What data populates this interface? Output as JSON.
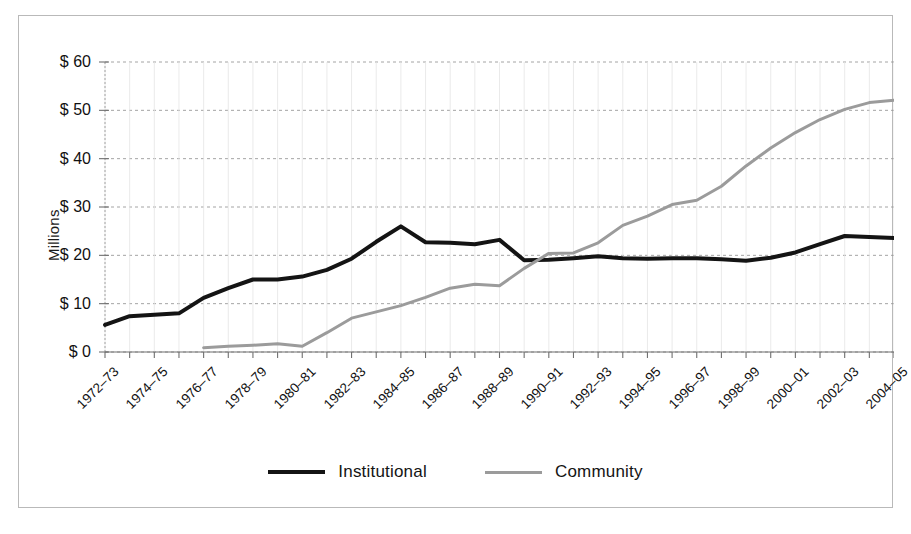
{
  "chart_data": {
    "type": "line",
    "title": "",
    "subtitle": "",
    "xlabel": "",
    "ylabel": "Millions",
    "ylim": [
      0,
      60
    ],
    "ytick_values": [
      0,
      10,
      20,
      30,
      40,
      50,
      60
    ],
    "ytick_labels": [
      "$ 0",
      "$ 10",
      "$ 20",
      "$ 30",
      "$ 40",
      "$ 50",
      "$ 60"
    ],
    "grid": true,
    "grid_style": "dashed-horizontal",
    "legend_position": "bottom-center",
    "x": [
      "1972-73",
      "1973-74",
      "1974-75",
      "1975-76",
      "1976-77",
      "1977-78",
      "1978-79",
      "1979-80",
      "1980-81",
      "1981-82",
      "1982-83",
      "1983-84",
      "1984-85",
      "1985-86",
      "1986-87",
      "1987-88",
      "1988-89",
      "1989-90",
      "1990-91",
      "1991-92",
      "1992-93",
      "1993-94",
      "1994-95",
      "1995-96",
      "1996-97",
      "1997-98",
      "1998-99",
      "1999-00",
      "2000-01",
      "2001-02",
      "2002-03",
      "2003-04",
      "2004-05"
    ],
    "xtick_labels": [
      "1972–73",
      "1974–75",
      "1976–77",
      "1978–79",
      "1980–81",
      "1982–83",
      "1984–85",
      "1986–87",
      "1988–89",
      "1990–91",
      "1992–93",
      "1994–95",
      "1996–97",
      "1998–99",
      "2000–01",
      "2002–03",
      "2004–05"
    ],
    "xtick_indices": [
      0,
      2,
      4,
      6,
      8,
      10,
      12,
      14,
      16,
      18,
      20,
      22,
      24,
      26,
      28,
      30,
      32
    ],
    "series": [
      {
        "name": "Institutional",
        "color": "#141414",
        "width": 4,
        "values": [
          5.6,
          7.4,
          7.7,
          8.0,
          11.2,
          13.2,
          15.0,
          15.0,
          15.6,
          17.0,
          19.3,
          22.8,
          26.0,
          22.7,
          22.6,
          22.3,
          23.2,
          19.0,
          19.1,
          19.4,
          19.8,
          19.4,
          19.3,
          19.4,
          19.4,
          19.2,
          18.9,
          19.5,
          20.6,
          22.3,
          24.0,
          23.8,
          23.6
        ]
      },
      {
        "name": "Community",
        "color": "#9b9b9b",
        "width": 3,
        "values": [
          null,
          null,
          null,
          null,
          0.9,
          1.2,
          1.4,
          1.7,
          1.2,
          4.0,
          7.0,
          8.3,
          9.6,
          11.3,
          13.2,
          14.0,
          13.7,
          17.3,
          20.4,
          20.5,
          22.6,
          26.2,
          28.1,
          30.5,
          31.4,
          34.3,
          38.5,
          42.2,
          45.4,
          48.1,
          50.2,
          51.6,
          52.1
        ]
      }
    ]
  },
  "legend": {
    "entries": [
      {
        "label": "Institutional",
        "swatch": "solid-dark-line"
      },
      {
        "label": "Community",
        "swatch": "solid-gray-line"
      }
    ]
  },
  "colors": {
    "institutional": "#141414",
    "community": "#9b9b9b",
    "grid": "#9a9a9a",
    "frame": "#b9b9b9",
    "axis": "#8c8c8c",
    "background": "#ffffff"
  }
}
